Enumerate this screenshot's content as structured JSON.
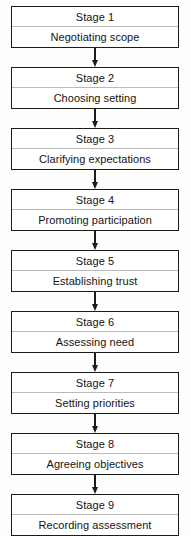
{
  "diagram": {
    "type": "vertical-flowchart",
    "orientation": "top-to-bottom",
    "connector_icon": "down-arrow-icon",
    "colors": {
      "border": "#1b1b1b",
      "divider": "#b9b9b9",
      "text": "#141414",
      "box_fill": "#ffffff",
      "background": "#fdfdfc"
    },
    "stages": [
      {
        "title": "Stage 1",
        "label": "Negotiating scope"
      },
      {
        "title": "Stage 2",
        "label": "Choosing setting"
      },
      {
        "title": "Stage 3",
        "label": "Clarifying expectations"
      },
      {
        "title": "Stage 4",
        "label": "Promoting participation"
      },
      {
        "title": "Stage 5",
        "label": "Establishing trust"
      },
      {
        "title": "Stage 6",
        "label": "Assessing need"
      },
      {
        "title": "Stage 7",
        "label": "Setting priorities"
      },
      {
        "title": "Stage 8",
        "label": "Agreeing objectives"
      },
      {
        "title": "Stage 9",
        "label": "Recording assessment"
      }
    ]
  }
}
